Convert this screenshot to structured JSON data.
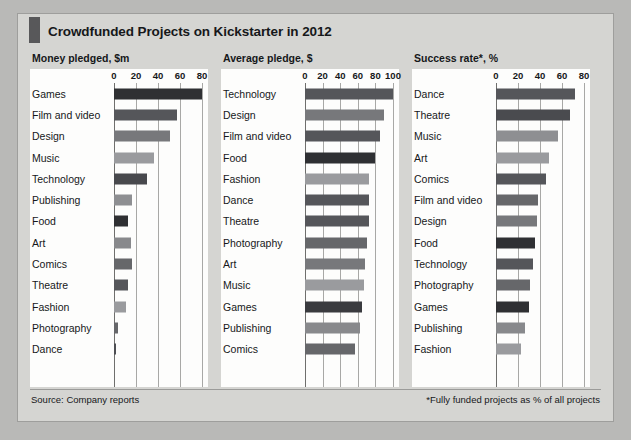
{
  "figure": {
    "title": "Crowdfunded Projects on Kickstarter in 2012",
    "source": "Source: Company reports",
    "footnote": "*Fully funded projects as % of all projects",
    "accent_color": "#58585a",
    "background_color": "#d5d5d2",
    "plot_background_color": "#fdfdfc",
    "text_color": "#16181a",
    "gridline_color": "#a8a8a6"
  },
  "chart_data": [
    {
      "type": "bar",
      "orientation": "horizontal",
      "title": "Money pledged, $m",
      "xlabel": "",
      "ylabel": "",
      "xlim": [
        0,
        80
      ],
      "ticks": [
        0,
        20,
        40,
        60,
        80
      ],
      "tick_labels": [
        "0",
        "20",
        "40",
        "60",
        "80"
      ],
      "grid": true,
      "legend": "none",
      "categories": [
        "Games",
        "Film and video",
        "Design",
        "Music",
        "Technology",
        "Publishing",
        "Food",
        "Art",
        "Comics",
        "Theatre",
        "Fashion",
        "Photography",
        "Dance"
      ],
      "values": [
        80,
        57,
        51,
        36,
        30,
        16,
        13,
        15,
        16,
        13,
        11,
        4,
        2
      ],
      "bar_colors": [
        "#2f3033",
        "#55565a",
        "#77787b",
        "#9a9b9e",
        "#48494d",
        "#8e8f92",
        "#2f3033",
        "#88898c",
        "#66676a",
        "#55565a",
        "#9a9b9e",
        "#66676a",
        "#4d4e52"
      ]
    },
    {
      "type": "bar",
      "orientation": "horizontal",
      "title": "Average pledge, $",
      "xlabel": "",
      "ylabel": "",
      "xlim": [
        0,
        100
      ],
      "ticks": [
        0,
        20,
        40,
        60,
        80,
        100
      ],
      "tick_labels": [
        "0",
        "20",
        "40",
        "60",
        "80",
        "100"
      ],
      "grid": true,
      "legend": "none",
      "categories": [
        "Technology",
        "Design",
        "Film and video",
        "Food",
        "Fashion",
        "Dance",
        "Theatre",
        "Photography",
        "Art",
        "Music",
        "Games",
        "Publishing",
        "Comics"
      ],
      "values": [
        100,
        90,
        85,
        80,
        73,
        73,
        73,
        71,
        68,
        67,
        65,
        62,
        57
      ],
      "bar_colors": [
        "#55565a",
        "#77787b",
        "#55565a",
        "#2f3033",
        "#9a9b9e",
        "#55565a",
        "#55565a",
        "#66676a",
        "#77787b",
        "#9a9b9e",
        "#3a3b3f",
        "#88898c",
        "#66676a"
      ]
    },
    {
      "type": "bar",
      "orientation": "horizontal",
      "title": "Success rate*, %",
      "xlabel": "",
      "ylabel": "",
      "xlim": [
        0,
        80
      ],
      "ticks": [
        0,
        20,
        40,
        60,
        80
      ],
      "tick_labels": [
        "0",
        "20",
        "40",
        "60",
        "80"
      ],
      "grid": true,
      "legend": "none",
      "categories": [
        "Dance",
        "Theatre",
        "Music",
        "Art",
        "Comics",
        "Film and video",
        "Design",
        "Food",
        "Technology",
        "Photography",
        "Games",
        "Publishing",
        "Fashion"
      ],
      "values": [
        72,
        67,
        56,
        48,
        45,
        38,
        37,
        35,
        34,
        31,
        30,
        26,
        23
      ],
      "bar_colors": [
        "#55565a",
        "#4a4b4f",
        "#8e8f92",
        "#9a9b9e",
        "#55565a",
        "#66676a",
        "#77787b",
        "#2f3033",
        "#55565a",
        "#66676a",
        "#2f3033",
        "#88898c",
        "#9a9b9e"
      ]
    }
  ]
}
